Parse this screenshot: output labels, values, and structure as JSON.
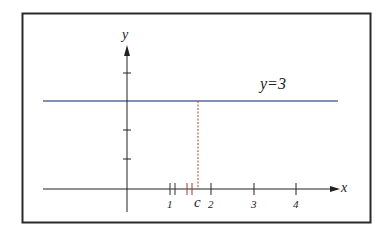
{
  "diagram": {
    "title": "",
    "axes": {
      "x_label": "x",
      "y_label": "y"
    },
    "line": {
      "label": "y=3",
      "equation_value": 3,
      "color": "#5a6a9a"
    },
    "point": {
      "label": "c",
      "dashed_color": "#c0392b"
    },
    "x_ticks": [
      {
        "label": "1",
        "value": 1
      },
      {
        "label": "2",
        "value": 2
      },
      {
        "label": "3",
        "value": 3
      },
      {
        "label": "4",
        "value": 4
      }
    ],
    "y_ticks": [
      1,
      2,
      3,
      4
    ],
    "colors": {
      "frame": "#2a2a2a",
      "axes": "#222222",
      "marks_near_1": "#333333",
      "marks_near_c": "#a0392b"
    }
  }
}
